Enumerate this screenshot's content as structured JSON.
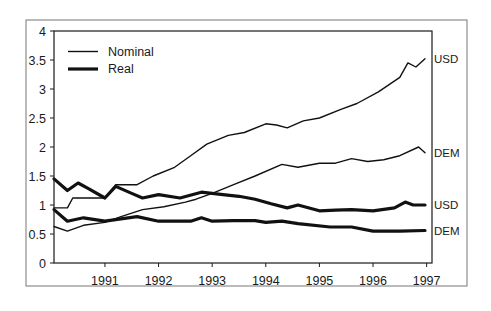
{
  "chart_data": {
    "type": "line",
    "title": "",
    "xlabel": "",
    "ylabel": "",
    "xlim": [
      1990.05,
      1997.1
    ],
    "ylim": [
      0,
      4
    ],
    "grid": false,
    "legend_position": "top-left inside",
    "x_ticks": [
      1991,
      1992,
      1993,
      1994,
      1995,
      1996,
      1997
    ],
    "x_tick_labels": [
      "1991",
      "1992",
      "1993",
      "1994",
      "1995",
      "1996",
      "1997"
    ],
    "y_ticks": [
      0,
      0.5,
      1,
      1.5,
      2,
      2.5,
      3,
      3.5,
      4
    ],
    "y_tick_labels": [
      "0",
      "0.5",
      "1",
      "1.5",
      "2",
      "2.5",
      "3",
      "3.5",
      "4"
    ],
    "legend": [
      {
        "label": "Nominal",
        "style": "thin"
      },
      {
        "label": "Real",
        "style": "thick"
      }
    ],
    "series": [
      {
        "name": "Nominal USD",
        "style": "thin",
        "end_label": "USD",
        "x": [
          1990.05,
          1990.3,
          1990.4,
          1990.7,
          1991.0,
          1991.2,
          1991.6,
          1991.9,
          1992.3,
          1992.6,
          1992.9,
          1993.3,
          1993.6,
          1994.0,
          1994.2,
          1994.4,
          1994.7,
          1995.0,
          1995.4,
          1995.7,
          1996.1,
          1996.5,
          1996.65,
          1996.8,
          1996.97
        ],
        "values": [
          0.95,
          0.95,
          1.12,
          1.12,
          1.12,
          1.35,
          1.35,
          1.5,
          1.65,
          1.85,
          2.05,
          2.2,
          2.25,
          2.4,
          2.38,
          2.33,
          2.45,
          2.5,
          2.65,
          2.75,
          2.95,
          3.2,
          3.45,
          3.38,
          3.52
        ]
      },
      {
        "name": "Nominal DEM",
        "style": "thin",
        "end_label": "DEM",
        "x": [
          1990.05,
          1990.3,
          1990.6,
          1991.0,
          1991.3,
          1991.7,
          1992.1,
          1992.5,
          1992.7,
          1993.0,
          1993.4,
          1993.8,
          1994.3,
          1994.6,
          1995.0,
          1995.3,
          1995.6,
          1995.9,
          1996.2,
          1996.5,
          1996.85,
          1996.97
        ],
        "values": [
          0.63,
          0.55,
          0.65,
          0.7,
          0.8,
          0.92,
          0.97,
          1.05,
          1.1,
          1.2,
          1.35,
          1.5,
          1.7,
          1.65,
          1.72,
          1.72,
          1.8,
          1.75,
          1.78,
          1.85,
          2.0,
          1.9
        ]
      },
      {
        "name": "Real USD",
        "style": "thick",
        "end_label": "USD",
        "x": [
          1990.05,
          1990.3,
          1990.5,
          1990.7,
          1991.0,
          1991.2,
          1991.5,
          1991.7,
          1992.0,
          1992.4,
          1992.8,
          1993.2,
          1993.5,
          1993.8,
          1994.1,
          1994.4,
          1994.6,
          1995.0,
          1995.3,
          1995.6,
          1996.0,
          1996.4,
          1996.6,
          1996.75,
          1996.97
        ],
        "values": [
          1.45,
          1.25,
          1.38,
          1.28,
          1.12,
          1.32,
          1.2,
          1.12,
          1.18,
          1.12,
          1.22,
          1.18,
          1.15,
          1.1,
          1.02,
          0.95,
          1.0,
          0.9,
          0.91,
          0.92,
          0.9,
          0.95,
          1.05,
          1.0,
          1.0
        ]
      },
      {
        "name": "Real DEM",
        "style": "thick",
        "end_label": "DEM",
        "x": [
          1990.05,
          1990.3,
          1990.6,
          1991.0,
          1991.3,
          1991.6,
          1992.0,
          1992.6,
          1992.8,
          1993.0,
          1993.4,
          1993.8,
          1994.0,
          1994.3,
          1994.6,
          1995.2,
          1995.6,
          1996.0,
          1996.5,
          1996.97
        ],
        "values": [
          0.92,
          0.72,
          0.78,
          0.72,
          0.76,
          0.8,
          0.72,
          0.72,
          0.78,
          0.72,
          0.73,
          0.73,
          0.7,
          0.72,
          0.68,
          0.62,
          0.62,
          0.55,
          0.55,
          0.56
        ]
      }
    ]
  },
  "layout": {
    "frame": {
      "x": 26,
      "y": 20,
      "w": 441,
      "h": 266
    },
    "plot": {
      "left": 54,
      "right": 432,
      "top": 31,
      "bottom": 263
    },
    "colors": {
      "line": "#111111",
      "axis": "#1a1a1a",
      "frame": "#777777",
      "background": "#ffffff"
    }
  }
}
